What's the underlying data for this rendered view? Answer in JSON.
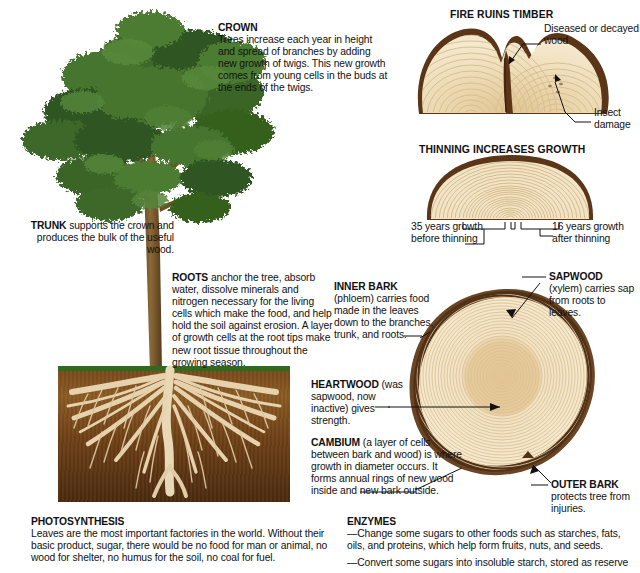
{
  "panels": {
    "crown": {
      "title": "CROWN",
      "body": "Trees increase each year in height and spread of branches by adding new growth of twigs. This new growth comes from young cells in the buds at the ends of the twigs."
    },
    "trunk": {
      "title": "TRUNK",
      "body": " supports the crown and produces the bulk of the useful wood."
    },
    "roots": {
      "title": "ROOTS",
      "body": " anchor the tree, absorb water, dissolve minerals and nitrogen necessary for the living cells which make the food, and help hold the soil against erosion. A layer of growth cells at the root tips make new root tissue throughout the growing season."
    },
    "inner_bark": {
      "title": "INNER BARK",
      "body": " (phloem) carries food made in the leaves down to the branches, trunk, and roots."
    },
    "heartwood": {
      "title": "HEARTWOOD",
      "body": " (was sapwood, now inactive) gives strength."
    },
    "cambium": {
      "title": "CAMBIUM",
      "body": " (a layer of cells between bark and wood) is where growth in diameter occurs. It forms annual rings of new wood inside and new bark outside."
    },
    "sapwood": {
      "title": "SAPWOOD",
      "body": "(xylem) carries sap from roots to leaves."
    },
    "outer_bark": {
      "title": "OUTER BARK",
      "body": "protects tree from injuries."
    },
    "photosynthesis": {
      "title": "PHOTOSYNTHESIS",
      "body": "Leaves are the most important factories in the world. Without their basic product, sugar, there would be no food for man or animal, no wood for shelter, no humus for the soil, no coal for fuel."
    },
    "enzymes": {
      "title": "ENZYMES",
      "line1": "—Change some sugars to other foods such as starches, fats, oils, and proteins, which help form fruits, nuts, and  seeds.",
      "line2": "—Convert some sugars into insoluble starch, stored as reserve"
    }
  },
  "fire_panel": {
    "title": "FIRE RUINS TIMBER",
    "label_decayed": "Diseased or decayed wood",
    "label_insect": "Insect damage"
  },
  "thinning_panel": {
    "title": "THINNING INCREASES GROWTH",
    "label_before": "35 years growth before thinning",
    "label_after": "16 years growth after thinning"
  },
  "colors": {
    "bark": "#6b4423",
    "bark_dark": "#4d2f17",
    "ring_light": "#f3e7cd",
    "ring_mid": "#e6d3ab",
    "heart": "#e2c894",
    "leaf": "#3f6b2b",
    "soil": "#7a4a1c",
    "grass": "#2e6b1f",
    "ink": "#111111"
  }
}
